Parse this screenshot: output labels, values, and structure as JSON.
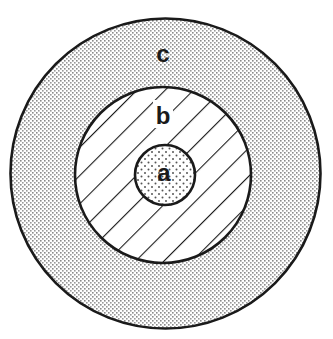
{
  "diagram": {
    "type": "concentric-circles",
    "colors": {
      "stroke": "#1a1a1a",
      "background": "#ffffff",
      "dot": "#8a8a8a"
    },
    "regions": [
      {
        "id": "c",
        "label": "c",
        "position": "outer ring",
        "fill_pattern": "fine-dot-stipple",
        "cx": 165.5,
        "cy": 173.5,
        "r": 155,
        "label_x": 163,
        "label_y": 62
      },
      {
        "id": "b",
        "label": "b",
        "position": "middle ring",
        "fill_pattern": "diagonal-hatch",
        "cx": 163,
        "cy": 175,
        "r": 88,
        "label_x": 163,
        "label_y": 124
      },
      {
        "id": "a",
        "label": "a",
        "position": "center core",
        "fill_pattern": "sparse-dot-stipple",
        "cx": 165,
        "cy": 175,
        "r": 30,
        "label_x": 164,
        "label_y": 181
      }
    ]
  }
}
